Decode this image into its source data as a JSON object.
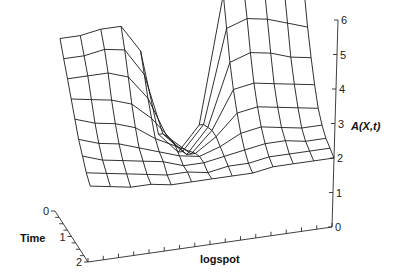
{
  "chart_data": {
    "type": "surface-wireframe",
    "title": "",
    "xlabel": "logspot",
    "ylabel": "Time",
    "zlabel": "A(X,t)",
    "z_ticks": [
      "0",
      "1",
      "2",
      "3",
      "4",
      "5",
      "6"
    ],
    "z_range": [
      0,
      6
    ],
    "time_ticks": [
      "0",
      "1",
      "2"
    ],
    "time_range": [
      0,
      2
    ],
    "x_tick_count": 16,
    "grid": false,
    "surface": {
      "rows_time": [
        0,
        0.25,
        0.5,
        0.75,
        1.0,
        1.25,
        1.5,
        1.75,
        2.0
      ],
      "cols_x": [
        0,
        1,
        2,
        3,
        4,
        5,
        6,
        7,
        8,
        9,
        10,
        11,
        12
      ],
      "z": [
        [
          5.0,
          5.0,
          5.1,
          5.1,
          4.3,
          1.8,
          1.2,
          1.9,
          5.6,
          5.7,
          5.7,
          5.5,
          5.3
        ],
        [
          4.6,
          4.6,
          4.7,
          4.6,
          3.8,
          2.0,
          1.4,
          2.1,
          4.8,
          5.0,
          4.9,
          4.7,
          4.5
        ],
        [
          4.2,
          4.2,
          4.2,
          4.0,
          3.3,
          2.1,
          1.5,
          2.2,
          4.0,
          4.2,
          4.1,
          3.9,
          3.8
        ],
        [
          3.8,
          3.7,
          3.6,
          3.4,
          2.9,
          2.2,
          1.7,
          2.3,
          3.4,
          3.5,
          3.4,
          3.3,
          3.2
        ],
        [
          3.4,
          3.2,
          3.1,
          2.9,
          2.5,
          2.2,
          1.9,
          2.3,
          2.9,
          3.0,
          2.9,
          2.8,
          2.7
        ],
        [
          3.0,
          2.8,
          2.7,
          2.5,
          2.3,
          2.1,
          2.0,
          2.2,
          2.5,
          2.6,
          2.5,
          2.4,
          2.4
        ],
        [
          2.7,
          2.5,
          2.4,
          2.3,
          2.2,
          2.0,
          2.0,
          2.1,
          2.2,
          2.3,
          2.3,
          2.2,
          2.2
        ],
        [
          2.4,
          2.3,
          2.2,
          2.1,
          2.0,
          2.0,
          1.9,
          2.0,
          2.0,
          2.1,
          2.1,
          2.1,
          2.1
        ],
        [
          2.2,
          2.1,
          2.0,
          2.0,
          1.9,
          1.9,
          1.9,
          1.9,
          1.9,
          2.0,
          2.0,
          2.0,
          2.0
        ]
      ]
    }
  }
}
